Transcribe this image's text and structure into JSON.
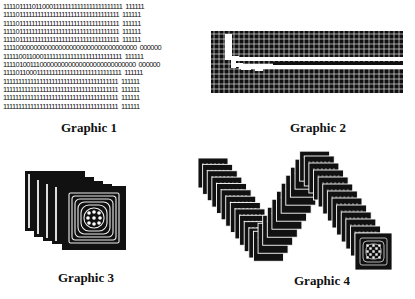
{
  "figure": {
    "panels": [
      {
        "id": "graphic-1",
        "caption": "Graphic 1",
        "kind": "binary-text",
        "rows": [
          "11110111101100011111111111111111111111  111111",
          "11110111111111111111111111111111111111  111111",
          "11110111111111111111111111111111111111  111111",
          "11110111111111111111111111111111111111  111111",
          "11110111111111111111111111111111111111  111111",
          "11110000000000000000000000000000000000  000000",
          "11111001100011111111111111111111111111  111111",
          "11110100111000000000000000000000000000  000000",
          "11110110001111111111111111111111111111  111111",
          "11111111111111111111111111111111111111  111111",
          "11111111111111111111111111111111111111  111111",
          "11111111111111111111111111111111111111  111111",
          "11111111111111111111111111111111111111  111111"
        ]
      },
      {
        "id": "graphic-2",
        "caption": "Graphic 2",
        "kind": "pixel-grid"
      },
      {
        "id": "graphic-3",
        "caption": "Graphic 3",
        "kind": "stacked-squares",
        "count": 5
      },
      {
        "id": "graphic-4",
        "caption": "Graphic 4",
        "kind": "wave-of-stacked-squares"
      }
    ]
  }
}
